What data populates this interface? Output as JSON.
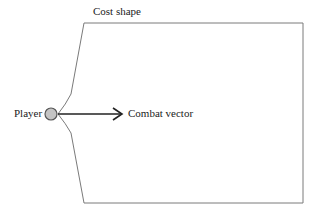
{
  "diagram": {
    "shape_label": "Cost shape",
    "player_label": "Player",
    "vector_label": "Combat vector",
    "colors": {
      "outline": "#7a7a7a",
      "arrow": "#222222",
      "player_fill": "#c4c4c4",
      "player_stroke": "#555555",
      "text": "#222222"
    }
  }
}
